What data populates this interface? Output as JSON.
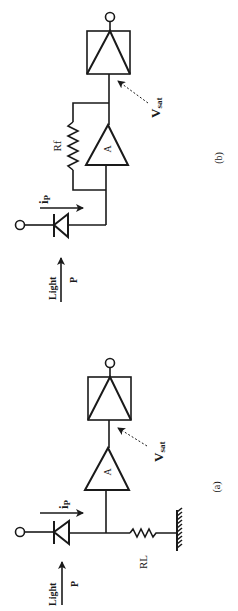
{
  "figure": {
    "colors": {
      "ink": "#1a1a1a",
      "background": "#ffffff"
    }
  },
  "circuit_b": {
    "caption": "(b)",
    "light_label": "Light",
    "power_label": "P",
    "current_label": "i",
    "current_sub": "P",
    "feedback_resistor_label": "Rf",
    "amplifier_label": "A",
    "vsat_label": "V",
    "vsat_sub": "sat"
  },
  "circuit_a": {
    "caption": "(a)",
    "light_label": "Light",
    "power_label": "P",
    "current_label": "i",
    "current_sub": "P",
    "load_resistor_label": "RL",
    "amplifier_label": "A",
    "vsat_label": "V",
    "vsat_sub": "sat"
  }
}
